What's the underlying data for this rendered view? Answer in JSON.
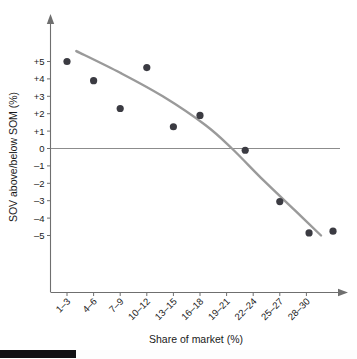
{
  "figure": {
    "name": "sov-vs-som-scatter"
  },
  "chart_data": {
    "type": "scatter",
    "title": "",
    "xlabel": "Share of market (%)",
    "ylabel": "SOV above/below SOM (%)",
    "categories": [
      "1–3",
      "4–6",
      "7–9",
      "10–12",
      "13–15",
      "16–18",
      "19–21",
      "22–24",
      "25–27",
      "28–30"
    ],
    "ytick_labels": [
      "+5",
      "+4",
      "+3",
      "+2",
      "+1",
      "0",
      "–1",
      "–2",
      "–3",
      "–4",
      "–5"
    ],
    "ytick_values": [
      5,
      4,
      3,
      2,
      1,
      0,
      -1,
      -2,
      -3,
      -4,
      -5
    ],
    "ylim": [
      -5,
      5
    ],
    "xlim": [
      0.5,
      11.2
    ],
    "grid": false,
    "legend": null,
    "zero_line": 0,
    "points": [
      {
        "category": "1–3",
        "x": 1,
        "y": 5.0
      },
      {
        "category": "4–6",
        "x": 2,
        "y": 3.9
      },
      {
        "category": "7–9",
        "x": 3,
        "y": 2.3
      },
      {
        "category": "10–12",
        "x": 4,
        "y": 4.65
      },
      {
        "category": "13–15",
        "x": 5,
        "y": 1.25
      },
      {
        "category": "16–18",
        "x": 6,
        "y": 1.9
      },
      {
        "category": "22–24",
        "x": 7.7,
        "y": -0.1
      },
      {
        "category": "25–27",
        "x": 9,
        "y": -3.05
      },
      {
        "category": "28–30",
        "x": 10.1,
        "y": -4.85
      },
      {
        "category": "",
        "x": 11.0,
        "y": -4.75
      }
    ],
    "trend_line": {
      "name": "fitted curve",
      "color": "#9a9a9a",
      "points": [
        {
          "x": 1.35,
          "y": 5.6
        },
        {
          "x": 3.0,
          "y": 4.35
        },
        {
          "x": 4.6,
          "y": 3.0
        },
        {
          "x": 6.2,
          "y": 1.35
        },
        {
          "x": 7.2,
          "y": 0.0
        },
        {
          "x": 8.4,
          "y": -1.85
        },
        {
          "x": 9.6,
          "y": -3.6
        },
        {
          "x": 10.55,
          "y": -5.0
        }
      ]
    }
  },
  "colors": {
    "dot": "#3b3b42",
    "curve": "#9a9a9a",
    "axis": "#6f6f6f",
    "zero_line": "#8c8c8c",
    "text": "#1a1a1a",
    "footer_bar": "#111114",
    "background": "#ffffff"
  }
}
